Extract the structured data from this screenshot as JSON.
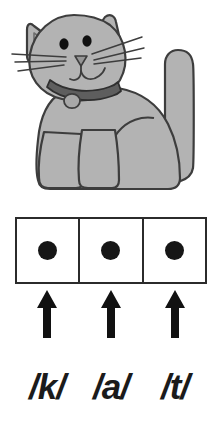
{
  "worksheet": {
    "title": "cat phoneme segmentation worksheet",
    "word": "cat"
  },
  "illustration": {
    "name": "cat-illustration",
    "subject": "cat",
    "body_color": "#b3b3b3",
    "outline_color": "#3d3d3d",
    "collar_color": "#5e5e5e",
    "tag_color": "#a8a8a8",
    "eye_color": "#111111",
    "nose_color": "#8f8f8f"
  },
  "sound_boxes": {
    "count": 3,
    "border_color": "#2b2b2b",
    "fill_color": "#ffffff",
    "dot_color": "#161616",
    "boxes": [
      {
        "index": 1,
        "marker": "dot"
      },
      {
        "index": 2,
        "marker": "dot"
      },
      {
        "index": 3,
        "marker": "dot"
      }
    ]
  },
  "arrows": {
    "direction": "up",
    "color": "#111111",
    "items": [
      {
        "index": 1,
        "points_to_box": 1
      },
      {
        "index": 2,
        "points_to_box": 2
      },
      {
        "index": 3,
        "points_to_box": 3
      }
    ]
  },
  "phonemes": {
    "color": "#1b1b1b",
    "items": [
      {
        "index": 1,
        "label": "/k/"
      },
      {
        "index": 2,
        "label": "/a/"
      },
      {
        "index": 3,
        "label": "/t/"
      }
    ]
  }
}
